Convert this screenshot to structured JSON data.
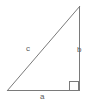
{
  "figure": {
    "name": "right-triangle-diagram",
    "background_color": "#ffffff",
    "stroke_color": "#7a7a7a",
    "label_color": "#5a5a5a",
    "stroke_width": 1,
    "canvas": {
      "width": 90,
      "height": 110
    },
    "vertices": {
      "bottom_left": {
        "x": 7,
        "y": 91
      },
      "bottom_right": {
        "x": 79,
        "y": 91
      },
      "top_right": {
        "x": 80,
        "y": 6
      }
    },
    "right_angle_marker": {
      "name": "right-angle-square",
      "x": 69,
      "y": 81,
      "size": 10,
      "at_vertex": "bottom_right"
    },
    "sides": [
      {
        "label": "a",
        "name": "base-side",
        "position": "bottom",
        "from": "bottom_left",
        "to": "bottom_right"
      },
      {
        "label": "b",
        "name": "vertical-side",
        "position": "right",
        "from": "bottom_right",
        "to": "top_right"
      },
      {
        "label": "c",
        "name": "hypotenuse-side",
        "position": "diagonal",
        "from": "bottom_left",
        "to": "top_right"
      }
    ]
  }
}
